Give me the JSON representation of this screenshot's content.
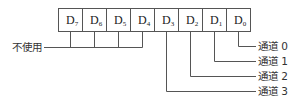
{
  "diagram": {
    "register": {
      "cells": [
        {
          "letter": "D",
          "sub": "7"
        },
        {
          "letter": "D",
          "sub": "6"
        },
        {
          "letter": "D",
          "sub": "5"
        },
        {
          "letter": "D",
          "sub": "4"
        },
        {
          "letter": "D",
          "sub": "3"
        },
        {
          "letter": "D",
          "sub": "2"
        },
        {
          "letter": "D",
          "sub": "1"
        },
        {
          "letter": "D",
          "sub": "0"
        }
      ]
    },
    "unused_label": "不使用",
    "channels": [
      {
        "label": "通道 0",
        "bit": "D0"
      },
      {
        "label": "通道 1",
        "bit": "D1"
      },
      {
        "label": "通道 2",
        "bit": "D2"
      },
      {
        "label": "通道 3",
        "bit": "D3"
      }
    ],
    "colors": {
      "line": "#555555",
      "text": "#222222",
      "background": "#ffffff"
    }
  }
}
